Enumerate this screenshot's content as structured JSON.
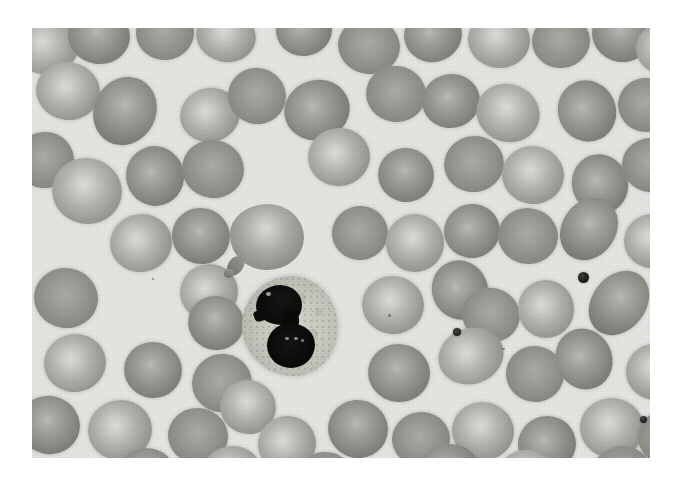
{
  "image": {
    "kind": "light-microscopy-photomicrograph",
    "subject": "peripheral blood smear",
    "stain": "Wright-Giemsa",
    "rendering": "grayscale",
    "plate": {
      "left": 32,
      "top": 28,
      "width": 618,
      "height": 430,
      "background_color": "#e7e7e4",
      "page_background_color": "#ffffff"
    },
    "palette": {
      "background": "#e7e7e4",
      "rbc_rim": "#83837e",
      "rbc_body": "#9a9a95",
      "rbc_central_pallor": "#d6d6d2",
      "wbc_cytoplasm": "#cacac1",
      "wbc_nucleus": "#0a0a09",
      "platelet": "#1d1d1c"
    }
  },
  "cells": {
    "white_blood_cell": {
      "label": "segmented-neutrophil",
      "lobe_count": 2,
      "position": {
        "left": 210,
        "top": 248,
        "width": 96,
        "height": 100
      },
      "nucleus_color": "#0a0a09",
      "cytoplasm_color": "#cacac1"
    },
    "teardrop": {
      "label": "dacrocyte-teardrop-cell",
      "position": {
        "left": 198,
        "top": 176,
        "width": 74,
        "height": 66
      }
    },
    "platelets": [
      {
        "left": 546,
        "top": 244,
        "size": 11
      },
      {
        "left": 421,
        "top": 300,
        "size": 8
      },
      {
        "left": 608,
        "top": 388,
        "size": 7
      }
    ],
    "red_blood_cells": [
      {
        "left": -18,
        "top": -12,
        "w": 66,
        "h": 58,
        "tone": "pale",
        "rot": -12
      },
      {
        "left": 36,
        "top": -20,
        "w": 62,
        "h": 56,
        "tone": "dark",
        "rot": 8
      },
      {
        "left": 104,
        "top": -22,
        "w": 58,
        "h": 54,
        "tone": "flat",
        "rot": -5
      },
      {
        "left": 164,
        "top": -18,
        "w": 60,
        "h": 52,
        "tone": "pale",
        "rot": 14
      },
      {
        "left": 244,
        "top": -24,
        "w": 56,
        "h": 52,
        "tone": "dark",
        "rot": -8
      },
      {
        "left": 306,
        "top": -10,
        "w": 62,
        "h": 56,
        "tone": "flat",
        "rot": 10
      },
      {
        "left": 372,
        "top": -20,
        "w": 58,
        "h": 54,
        "tone": "dark",
        "rot": -14
      },
      {
        "left": 436,
        "top": -16,
        "w": 62,
        "h": 56,
        "tone": "pale",
        "rot": 6
      },
      {
        "left": 500,
        "top": -14,
        "w": 58,
        "h": 54,
        "tone": "flat",
        "rot": -6
      },
      {
        "left": 560,
        "top": -22,
        "w": 60,
        "h": 56,
        "tone": "dark",
        "rot": 12
      },
      {
        "left": 604,
        "top": -6,
        "w": 56,
        "h": 52,
        "tone": "pale",
        "rot": -9
      },
      {
        "left": 4,
        "top": 34,
        "w": 64,
        "h": 58,
        "tone": "pale",
        "rot": 10
      },
      {
        "left": 62,
        "top": 48,
        "w": 62,
        "h": 70,
        "tone": "dark",
        "rot": 28
      },
      {
        "left": 148,
        "top": 60,
        "w": 60,
        "h": 54,
        "tone": "pale",
        "rot": -12
      },
      {
        "left": 196,
        "top": 40,
        "w": 58,
        "h": 56,
        "tone": "flat",
        "rot": 16
      },
      {
        "left": 252,
        "top": 52,
        "w": 66,
        "h": 60,
        "tone": "dark",
        "rot": -18
      },
      {
        "left": 334,
        "top": 38,
        "w": 60,
        "h": 56,
        "tone": "flat",
        "rot": 8
      },
      {
        "left": 390,
        "top": 46,
        "w": 58,
        "h": 54,
        "tone": "dark",
        "rot": -10
      },
      {
        "left": 444,
        "top": 56,
        "w": 64,
        "h": 58,
        "tone": "pale",
        "rot": 20
      },
      {
        "left": 526,
        "top": 52,
        "w": 58,
        "h": 62,
        "tone": "dark",
        "rot": -24
      },
      {
        "left": 586,
        "top": 50,
        "w": 56,
        "h": 54,
        "tone": "flat",
        "rot": 6
      },
      {
        "left": -16,
        "top": 104,
        "w": 58,
        "h": 56,
        "tone": "flat",
        "rot": -8
      },
      {
        "left": 20,
        "top": 130,
        "w": 70,
        "h": 66,
        "tone": "pale",
        "rot": 12
      },
      {
        "left": 94,
        "top": 118,
        "w": 58,
        "h": 60,
        "tone": "dark",
        "rot": -16
      },
      {
        "left": 150,
        "top": 112,
        "w": 62,
        "h": 58,
        "tone": "flat",
        "rot": 10
      },
      {
        "left": 276,
        "top": 100,
        "w": 62,
        "h": 58,
        "tone": "pale",
        "rot": -6
      },
      {
        "left": 346,
        "top": 120,
        "w": 56,
        "h": 54,
        "tone": "dark",
        "rot": 14
      },
      {
        "left": 412,
        "top": 108,
        "w": 60,
        "h": 56,
        "tone": "flat",
        "rot": -12
      },
      {
        "left": 470,
        "top": 118,
        "w": 62,
        "h": 58,
        "tone": "pale",
        "rot": 8
      },
      {
        "left": 540,
        "top": 126,
        "w": 56,
        "h": 60,
        "tone": "dark",
        "rot": -20
      },
      {
        "left": 590,
        "top": 110,
        "w": 58,
        "h": 54,
        "tone": "flat",
        "rot": 5
      },
      {
        "left": 78,
        "top": 186,
        "w": 62,
        "h": 58,
        "tone": "pale",
        "rot": -10
      },
      {
        "left": 140,
        "top": 180,
        "w": 58,
        "h": 56,
        "tone": "dark",
        "rot": 16
      },
      {
        "left": 300,
        "top": 178,
        "w": 56,
        "h": 54,
        "tone": "flat",
        "rot": -8
      },
      {
        "left": 354,
        "top": 186,
        "w": 58,
        "h": 58,
        "tone": "pale",
        "rot": 12
      },
      {
        "left": 412,
        "top": 176,
        "w": 56,
        "h": 54,
        "tone": "dark",
        "rot": -14
      },
      {
        "left": 466,
        "top": 180,
        "w": 60,
        "h": 56,
        "tone": "flat",
        "rot": 6
      },
      {
        "left": 530,
        "top": 168,
        "w": 54,
        "h": 66,
        "tone": "dark",
        "rot": 34
      },
      {
        "left": 592,
        "top": 186,
        "w": 56,
        "h": 54,
        "tone": "pale",
        "rot": -6
      },
      {
        "left": 2,
        "top": 240,
        "w": 64,
        "h": 60,
        "tone": "flat",
        "rot": 10
      },
      {
        "left": 148,
        "top": 236,
        "w": 58,
        "h": 56,
        "tone": "pale",
        "rot": -12
      },
      {
        "left": 156,
        "top": 268,
        "w": 56,
        "h": 54,
        "tone": "dark",
        "rot": 18
      },
      {
        "left": 330,
        "top": 248,
        "w": 62,
        "h": 58,
        "tone": "pale",
        "rot": 8
      },
      {
        "left": 400,
        "top": 232,
        "w": 56,
        "h": 60,
        "tone": "dark",
        "rot": -22
      },
      {
        "left": 430,
        "top": 260,
        "w": 58,
        "h": 54,
        "tone": "flat",
        "rot": 14
      },
      {
        "left": 486,
        "top": 252,
        "w": 56,
        "h": 58,
        "tone": "pale",
        "rot": -10
      },
      {
        "left": 560,
        "top": 240,
        "w": 54,
        "h": 70,
        "tone": "dark",
        "rot": 38
      },
      {
        "left": 12,
        "top": 306,
        "w": 62,
        "h": 58,
        "tone": "pale",
        "rot": -8
      },
      {
        "left": 92,
        "top": 314,
        "w": 58,
        "h": 56,
        "tone": "dark",
        "rot": 12
      },
      {
        "left": 160,
        "top": 326,
        "w": 60,
        "h": 58,
        "tone": "flat",
        "rot": -16
      },
      {
        "left": 188,
        "top": 352,
        "w": 56,
        "h": 54,
        "tone": "pale",
        "rot": 20
      },
      {
        "left": 336,
        "top": 316,
        "w": 62,
        "h": 58,
        "tone": "dark",
        "rot": 6
      },
      {
        "left": 406,
        "top": 300,
        "w": 66,
        "h": 56,
        "tone": "pale",
        "rot": -18
      },
      {
        "left": 474,
        "top": 318,
        "w": 58,
        "h": 56,
        "tone": "flat",
        "rot": 10
      },
      {
        "left": 524,
        "top": 300,
        "w": 56,
        "h": 62,
        "tone": "dark",
        "rot": -26
      },
      {
        "left": 594,
        "top": 316,
        "w": 58,
        "h": 56,
        "tone": "pale",
        "rot": 8
      },
      {
        "left": -14,
        "top": 368,
        "w": 62,
        "h": 58,
        "tone": "dark",
        "rot": 14
      },
      {
        "left": 56,
        "top": 372,
        "w": 64,
        "h": 60,
        "tone": "pale",
        "rot": -10
      },
      {
        "left": 136,
        "top": 380,
        "w": 60,
        "h": 56,
        "tone": "flat",
        "rot": 8
      },
      {
        "left": 226,
        "top": 388,
        "w": 58,
        "h": 56,
        "tone": "pale",
        "rot": -14
      },
      {
        "left": 296,
        "top": 372,
        "w": 60,
        "h": 58,
        "tone": "dark",
        "rot": 16
      },
      {
        "left": 360,
        "top": 384,
        "w": 58,
        "h": 54,
        "tone": "flat",
        "rot": -6
      },
      {
        "left": 420,
        "top": 374,
        "w": 62,
        "h": 58,
        "tone": "pale",
        "rot": 10
      },
      {
        "left": 486,
        "top": 388,
        "w": 58,
        "h": 56,
        "tone": "dark",
        "rot": -12
      },
      {
        "left": 548,
        "top": 370,
        "w": 64,
        "h": 60,
        "tone": "pale",
        "rot": 6
      },
      {
        "left": 606,
        "top": 382,
        "w": 56,
        "h": 54,
        "tone": "flat",
        "rot": -8
      },
      {
        "left": 86,
        "top": 420,
        "w": 58,
        "h": 54,
        "tone": "dark",
        "rot": 10
      },
      {
        "left": 170,
        "top": 418,
        "w": 60,
        "h": 56,
        "tone": "pale",
        "rot": -10
      },
      {
        "left": 266,
        "top": 424,
        "w": 56,
        "h": 52,
        "tone": "flat",
        "rot": 12
      },
      {
        "left": 386,
        "top": 416,
        "w": 62,
        "h": 56,
        "tone": "dark",
        "rot": -8
      },
      {
        "left": 466,
        "top": 422,
        "w": 58,
        "h": 54,
        "tone": "pale",
        "rot": 14
      },
      {
        "left": 560,
        "top": 418,
        "w": 60,
        "h": 56,
        "tone": "flat",
        "rot": -6
      }
    ]
  }
}
